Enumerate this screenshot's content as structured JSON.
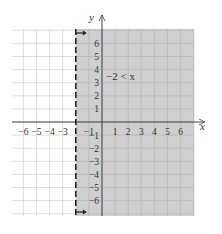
{
  "chart_data": {
    "type": "area",
    "title": "",
    "xlabel": "x",
    "ylabel": "y",
    "xlim": [
      -7,
      7
    ],
    "ylim": [
      -7,
      7
    ],
    "grid": true,
    "x_ticks": [
      -6,
      -5,
      -4,
      -3,
      -1,
      1,
      2,
      3,
      4,
      5,
      6
    ],
    "y_ticks": [
      6,
      5,
      4,
      3,
      2,
      1,
      -1,
      -2,
      -3,
      -4,
      -5,
      -6
    ],
    "boundary": {
      "type": "vertical_line",
      "x": -2,
      "style": "dashed",
      "inclusive": false
    },
    "shaded_region": {
      "description": "x > -2",
      "from_x": -2,
      "to_x": 7
    },
    "annotation": "−2 < x",
    "arrows": [
      {
        "position": "top",
        "direction": "right",
        "at_x": -2
      },
      {
        "position": "bottom",
        "direction": "right",
        "at_x": -2
      }
    ],
    "colors": {
      "shade": "#cfcfcf",
      "grid_light": "#d8d8d8",
      "grid_shaded": "#b8b8b8",
      "axis": "#444444",
      "boundary": "#222222"
    }
  },
  "labels": {
    "x_axis": "x",
    "y_axis": "y",
    "inequality": "−2 < x",
    "x_tick_text": [
      "−6",
      "−5",
      "−4",
      "−3",
      "−1",
      "1",
      "2",
      "3",
      "4",
      "5",
      "6"
    ],
    "y_tick_text": [
      "6",
      "5",
      "4",
      "3",
      "2",
      "1",
      "−1",
      "−2",
      "−3",
      "−4",
      "−5",
      "−6"
    ]
  }
}
